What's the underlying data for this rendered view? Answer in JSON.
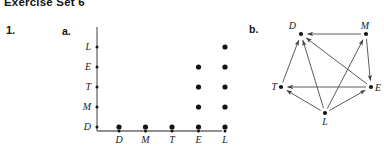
{
  "header": {
    "title": "Exercise Set 6"
  },
  "problem": {
    "number": "1.",
    "part_a_label": "a.",
    "part_b_label": "b."
  },
  "colors": {
    "ink": "#1a1a1a",
    "axis": "#6b6b6b",
    "dot": "#141414",
    "edge": "#4a4a4a"
  },
  "chart_data": {
    "type": "scatter",
    "title": "",
    "xlabel": "",
    "ylabel": "",
    "x_categories": [
      "D",
      "M",
      "T",
      "E",
      "L"
    ],
    "y_categories": [
      "D",
      "M",
      "T",
      "E",
      "L"
    ],
    "y_categories_top_to_bottom": [
      "L",
      "E",
      "T",
      "M",
      "D"
    ],
    "grid": false,
    "legend": "none",
    "points": [
      {
        "x": "D",
        "y": "D"
      },
      {
        "x": "M",
        "y": "D"
      },
      {
        "x": "T",
        "y": "D"
      },
      {
        "x": "E",
        "y": "D"
      },
      {
        "x": "L",
        "y": "D"
      },
      {
        "x": "E",
        "y": "M"
      },
      {
        "x": "L",
        "y": "M"
      },
      {
        "x": "E",
        "y": "T"
      },
      {
        "x": "L",
        "y": "T"
      },
      {
        "x": "E",
        "y": "E"
      },
      {
        "x": "L",
        "y": "E"
      },
      {
        "x": "L",
        "y": "L"
      }
    ]
  },
  "digraph": {
    "type": "directed-graph",
    "nodes": [
      {
        "id": "D",
        "label": "D",
        "cx": 46,
        "cy": 18
      },
      {
        "id": "M",
        "label": "M",
        "cx": 111,
        "cy": 18
      },
      {
        "id": "T",
        "label": "T",
        "cx": 26,
        "cy": 71
      },
      {
        "id": "E",
        "label": "E",
        "cx": 116,
        "cy": 71
      },
      {
        "id": "L",
        "label": "L",
        "cx": 70,
        "cy": 97
      }
    ],
    "edges": [
      {
        "from": "M",
        "to": "D"
      },
      {
        "from": "T",
        "to": "D"
      },
      {
        "from": "E",
        "to": "D"
      },
      {
        "from": "L",
        "to": "D"
      },
      {
        "from": "E",
        "to": "T"
      },
      {
        "from": "L",
        "to": "T"
      },
      {
        "from": "L",
        "to": "E"
      },
      {
        "from": "L",
        "to": "M"
      },
      {
        "from": "M",
        "to": "E"
      }
    ]
  }
}
